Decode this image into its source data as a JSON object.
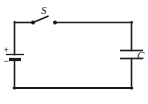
{
  "diagram": {
    "background_color": "#ffffff",
    "line_color": "#1c1c1c",
    "line_width": 1.6,
    "components": {
      "switch": {
        "name": "switch",
        "label": "S",
        "state": "open",
        "left_contact": {
          "x": 33,
          "y": 22.5
        },
        "right_contact": {
          "x": 55,
          "y": 22.5
        },
        "lever_tip": {
          "x": 47.5,
          "y": 16.5
        },
        "label_pos": {
          "x": 41,
          "y": 14
        }
      },
      "battery": {
        "name": "battery",
        "plus_sign": "+",
        "minus_sign": "−",
        "plus_pos": {
          "x": 4,
          "y": 52
        },
        "minus_pos": {
          "x": 4,
          "y": 63
        },
        "long_plate": {
          "x1": 6,
          "x2": 24,
          "y": 54.5,
          "width": 1.3
        },
        "short_plate": {
          "x1": 9,
          "x2": 21,
          "y": 59.5,
          "width": 3.2
        }
      },
      "capacitor": {
        "name": "capacitor",
        "label": "C",
        "top_plate": {
          "x1": 120,
          "x2": 142,
          "y": 50.5
        },
        "bottom_plate": {
          "x1": 120,
          "x2": 142,
          "y": 58.5
        },
        "label_pos": {
          "x": 136,
          "y": 58
        }
      }
    },
    "wires": {
      "top_left": {
        "x1": 14.5,
        "y1": 22.5,
        "x2": 33,
        "y2": 22.5
      },
      "top_right": {
        "x1": 55,
        "y1": 22.5,
        "x2": 131.5,
        "y2": 22.5
      },
      "left_upper": {
        "x1": 14.5,
        "y1": 22.5,
        "x2": 14.5,
        "y2": 54.5
      },
      "left_lower": {
        "x1": 14.5,
        "y1": 59.5,
        "x2": 14.5,
        "y2": 88
      },
      "bottom": {
        "x1": 14.5,
        "y1": 88,
        "x2": 131.5,
        "y2": 88
      },
      "right_upper": {
        "x1": 131.5,
        "y1": 22.5,
        "x2": 131.5,
        "y2": 50.5
      },
      "right_lower": {
        "x1": 131.5,
        "y1": 58.5,
        "x2": 131.5,
        "y2": 88
      }
    },
    "contact_dot_radius": 2
  }
}
